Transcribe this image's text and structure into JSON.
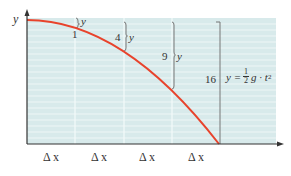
{
  "diagram": {
    "y_axis_label": "y",
    "x_interval_label": "Δ x",
    "x_intervals": [
      "Δ x",
      "Δ x",
      "Δ x",
      "Δ x"
    ],
    "drops": [
      {
        "value": "1",
        "var": "y"
      },
      {
        "value": "4",
        "var": "y"
      },
      {
        "value": "9",
        "var": "y"
      },
      {
        "value": "16",
        "var": "y"
      }
    ],
    "formula": {
      "lhs": "y =",
      "num": "1",
      "den": "2",
      "rhs": "g · t",
      "exp": "2"
    },
    "colors": {
      "background": "#d8eaeb",
      "curve": "#e8432c",
      "axis": "#333333",
      "gridline": "#f2f8f8",
      "bracket": "#666666"
    }
  }
}
